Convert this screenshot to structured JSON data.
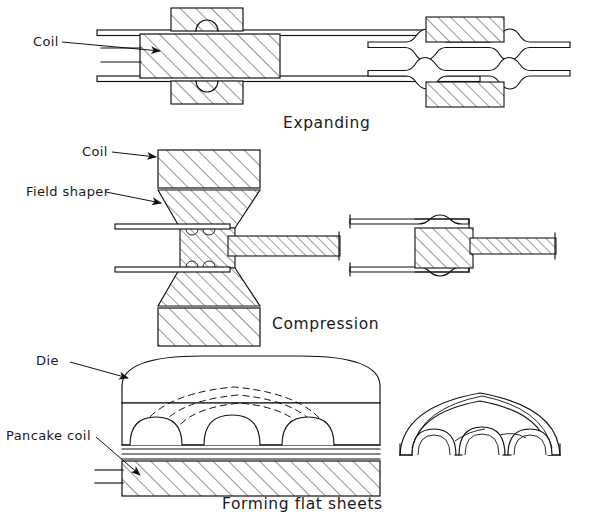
{
  "document": {
    "type": "technical-line-diagram",
    "title": "Electromagnetic forming process schematics",
    "background_color": "#ffffff",
    "line_color": "#111111",
    "page_width": 590,
    "page_height": 531
  },
  "panels": [
    {
      "id": "expanding",
      "caption": "Expanding",
      "caption_x": 283,
      "caption_y": 128,
      "labels": [
        {
          "text": "Coil",
          "x": 33,
          "y": 46
        }
      ],
      "left_view": "tubular workpiece with internal coil, cross-section, hatched coil block between two tube walls",
      "right_view": "formed tube with outward bulges after expansion"
    },
    {
      "id": "compression",
      "caption": "Compression",
      "caption_x": 272,
      "caption_y": 329,
      "labels": [
        {
          "text": "Coil",
          "x": 82,
          "y": 156
        },
        {
          "text": "Field shaper",
          "x": 26,
          "y": 196
        }
      ],
      "left_view": "coil above and below, tapered field shaper concentrating field onto tube over mandrel",
      "right_view": "tube compressed onto inner shaft, corrugated joint"
    },
    {
      "id": "forming-flat-sheets",
      "caption": "Forming flat sheets",
      "caption_x": 222,
      "caption_y": 509,
      "labels": [
        {
          "text": "Die",
          "x": 36,
          "y": 365
        },
        {
          "text": "Pancake coil",
          "x": 6,
          "y": 440
        }
      ],
      "left_view": "domed die cavity above flat sheet driven upward by flat pancake coil, dashed magnetic field lines",
      "right_view": "three-dimensional view of formed corrugated dome panel"
    }
  ],
  "icons": {
    "arrow": "leader-arrowhead",
    "hatching": "section-hatch-45deg",
    "dashed": "magnetic-field-line"
  }
}
